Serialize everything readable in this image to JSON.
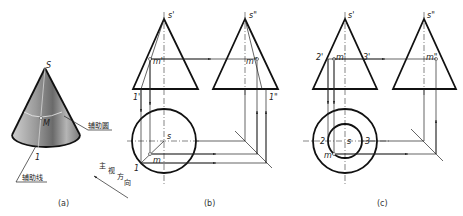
{
  "figure_a": {
    "caption": "(a)",
    "apex_label": "S",
    "point_label": "M",
    "base_point_label": "1",
    "aux_circle_label": "辅助圆",
    "aux_line_label": "辅助线",
    "view_direction_label": [
      "主",
      "视",
      "方",
      "向"
    ]
  },
  "figure_b": {
    "caption": "(b)",
    "front_apex": "s'",
    "side_apex": "s\"",
    "front_point": "m'",
    "side_point": "m\"",
    "front_base_point": "1'",
    "side_base_point": "1\"",
    "top_center": "s",
    "top_point": "m",
    "top_base_point": "1"
  },
  "figure_c": {
    "caption": "(c)",
    "front_apex": "s'",
    "side_apex": "s\"",
    "front_point": "m'",
    "side_point": "m\"",
    "front_left": "2'",
    "front_right": "3'",
    "top_center": "s",
    "top_point": "m",
    "top_left": "2",
    "top_right": "3"
  }
}
